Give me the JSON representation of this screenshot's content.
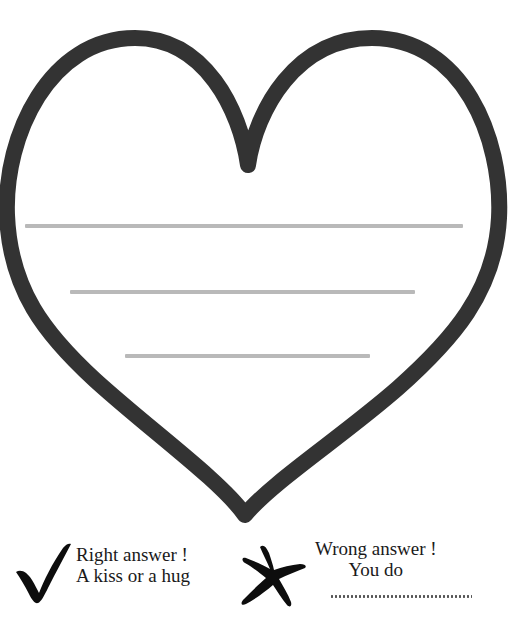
{
  "page": {
    "background_color": "#ffffff"
  },
  "heart_card": {
    "icon": "heart-outline-icon",
    "stroke_color": "#333333",
    "fill_color": "#ffffff",
    "stroke_width": 16,
    "writing_lines": [
      {
        "name": "writing-line-1",
        "color": "#b9b9b9",
        "x": 25,
        "y": 224,
        "width": 438
      },
      {
        "name": "writing-line-2",
        "color": "#b9b9b9",
        "x": 70,
        "y": 290,
        "width": 345
      },
      {
        "name": "writing-line-3",
        "color": "#b9b9b9",
        "x": 125,
        "y": 354,
        "width": 245
      }
    ]
  },
  "answer_key": {
    "right": {
      "icon": "checkmark-icon",
      "icon_color": "#0d0d0d",
      "line1": "Right answer !",
      "line2": "A kiss or a hug"
    },
    "wrong": {
      "icon": "cross-x-icon",
      "icon_color": "#0d0d0d",
      "line1": "Wrong answer !",
      "line2": "You do",
      "fill_in_rule": "dotted-line",
      "fill_in_rule_color": "#555555"
    }
  }
}
